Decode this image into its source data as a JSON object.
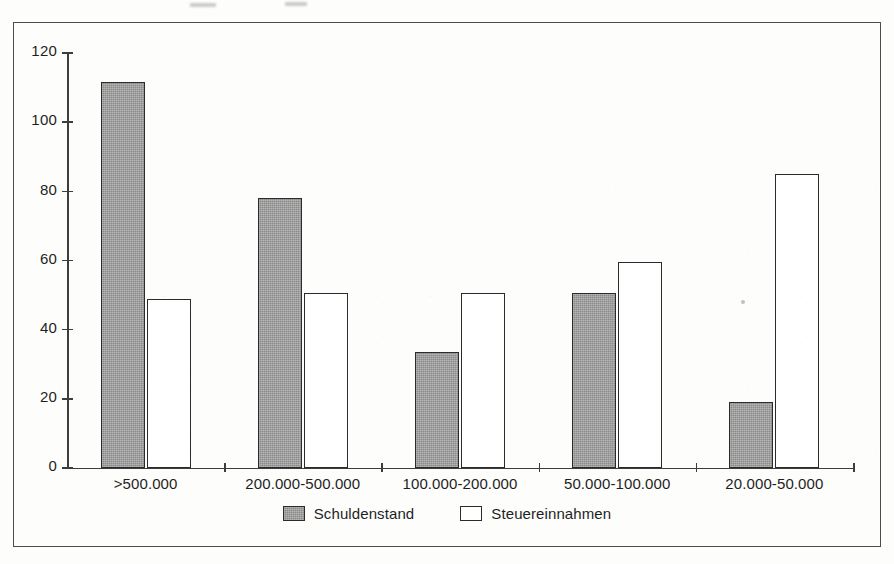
{
  "chart_data": {
    "type": "bar",
    "title": "",
    "subtitle": "",
    "xlabel": "",
    "ylabel": "",
    "categories": [
      ">500.000",
      "200.000-500.000",
      "100.000-200.000",
      "50.000-100.000",
      "20.000-50.000"
    ],
    "series": [
      {
        "name": "Schuldenstand",
        "color": "#8a8a8a",
        "fill": "gray-hatched",
        "values": [
          111.5,
          78,
          33.5,
          50.5,
          19
        ]
      },
      {
        "name": "Steuereinnahmen",
        "color": "#ffffff",
        "fill": "white-outline",
        "values": [
          49,
          50.5,
          50.5,
          59.5,
          85
        ]
      }
    ],
    "ylim": [
      0,
      120
    ],
    "ytick_values": [
      0,
      20,
      40,
      60,
      80,
      100,
      120
    ],
    "ytick_labels": [
      "0",
      "20",
      "40",
      "60",
      "80",
      "100",
      "120"
    ],
    "grid": false,
    "legend_position": "bottom-center",
    "bar_outline_color": "#2b2b2b",
    "axis_color": "#3d3d3d",
    "frame_color": "#4c4c4c",
    "background": "#ffffff"
  },
  "legend": {
    "items": [
      {
        "label": "Schuldenstand",
        "swatch": "gray"
      },
      {
        "label": "Steuereinnahmen",
        "swatch": "white"
      }
    ]
  },
  "icons": {
    "legend_swatch_filled": "filled-square-icon",
    "legend_swatch_outline": "outline-square-icon"
  }
}
